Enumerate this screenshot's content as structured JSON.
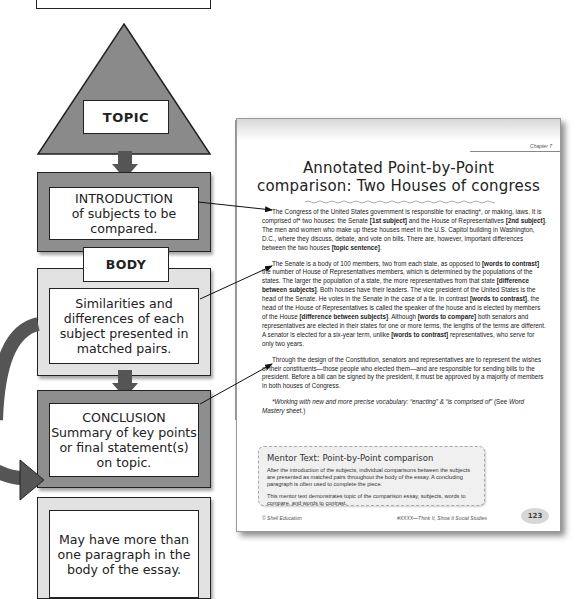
{
  "diagram": {
    "top_label": "TOPIC",
    "introduction": {
      "heading": "INTRODUCTION",
      "text": "of subjects to be compared."
    },
    "body": {
      "label": "BODY",
      "text": "Similarities and differences of each subject presented in matched pairs."
    },
    "conclusion": {
      "heading": "CONCLUSION",
      "text": "Summary of key points or final statement(s) on topic."
    },
    "note": {
      "text": "May have more than one paragraph in the body of the essay."
    },
    "colors": {
      "dark_fill": "#8e8e8e",
      "light_fill": "#e2e2e2",
      "triangle_fill": "#8a8a8a",
      "arrow_fill": "#555555",
      "outline": "#222222"
    }
  },
  "document": {
    "chapter": "Chapter 7",
    "title_line1": "Annotated Point-by-Point",
    "title_line2": "comparison: Two Houses of congress",
    "paragraphs": [
      [
        {
          "t": "The Congress of the United States government is responsible for enacting*, or making, laws. It is comprised of* two houses: the Senate "
        },
        {
          "t": "[1st subject]",
          "b": true
        },
        {
          "t": " and the House of Representatives "
        },
        {
          "t": "[2nd subject]",
          "b": true
        },
        {
          "t": ". The men and women who make up these houses meet in the U.S. Capitol building in Washington, D.C., where they discuss, debate, and vote on bills. There are, however, important differences between the two houses "
        },
        {
          "t": "[topic sentence]",
          "b": true
        },
        {
          "t": "."
        }
      ],
      [
        {
          "t": "The Senate is a body of 100 members, two from each state, as opposed to "
        },
        {
          "t": "[words to contrast]",
          "b": true
        },
        {
          "t": " the number of House of Representatives members, which is determined by the populations of the states. The larger the population of a state, the more representatives from that state "
        },
        {
          "t": "[difference between subjects]",
          "b": true
        },
        {
          "t": ". Both houses have their leaders. The vice president of the United States is the head of the Senate. He votes in the Senate in the case of a tie. In contrast "
        },
        {
          "t": "[words to contrast]",
          "b": true
        },
        {
          "t": ", the head of the House of Representatives is called the speaker of the house and is elected by members of the House "
        },
        {
          "t": "[difference between subjects]",
          "b": true
        },
        {
          "t": ". Although "
        },
        {
          "t": "[words to compare]",
          "b": true
        },
        {
          "t": " both senators and representatives are elected in their states for one or more terms, the lengths of the terms are different. A senator is elected for a six-year term, unlike "
        },
        {
          "t": "[words to contrast]",
          "b": true
        },
        {
          "t": " representatives, who serve for only two years."
        }
      ],
      [
        {
          "t": "Through the design of the Constitution, senators and representatives are to represent the wishes of their constituents—those people who elected them—and are responsible for sending bills to the president. Before a bill can be signed by the president, it must be approved by a majority of members in both houses of Congress."
        }
      ],
      [
        {
          "t": "*Working with new and more precise vocabulary: “enacting” & “is comprised of” ",
          "i": true
        },
        {
          "t": "(See "
        },
        {
          "t": "Word Mastery",
          "i": true
        },
        {
          "t": " sheet.)"
        }
      ]
    ],
    "mentor_box": {
      "title": "Mentor Text: Point-by-Point comparison",
      "p1": "After the introduction of the subjects, individual comparisons between the subjects are presented as matched pairs throughout the body of the essay. A concluding paragraph is often used to complete the piece.",
      "p2": "This mentor text demonstrates topic of the comparison essay, subjects, words to compare, and words to contrast."
    },
    "footer": {
      "left": "© Shell Education",
      "right": "#XXXX—Think It, Show It Social Studies",
      "page_number": "123"
    }
  }
}
